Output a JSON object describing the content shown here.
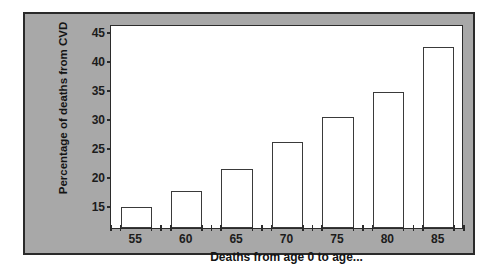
{
  "chart_data": {
    "type": "bar",
    "title": "",
    "xlabel": "Deaths from age 0 to age...",
    "ylabel": "Percentage of deaths from CVD",
    "categories": [
      "55",
      "60",
      "65",
      "70",
      "75",
      "80",
      "85"
    ],
    "values": [
      14.8,
      17.6,
      21.3,
      26.0,
      30.4,
      34.6,
      42.5
    ],
    "yticks": [
      "15",
      "20",
      "25",
      "30",
      "35",
      "40",
      "45"
    ],
    "ytick_values": [
      15,
      20,
      25,
      30,
      35,
      40,
      45
    ],
    "ylim": [
      11.2,
      46.4
    ],
    "grid": false,
    "legend": "none",
    "bar_fill": "#ffffff",
    "bar_edge": "#3a3a3a",
    "panel_background": "#a8a8a8",
    "plot_background": "#ffffff",
    "axis_color": "#2b2b2b"
  }
}
